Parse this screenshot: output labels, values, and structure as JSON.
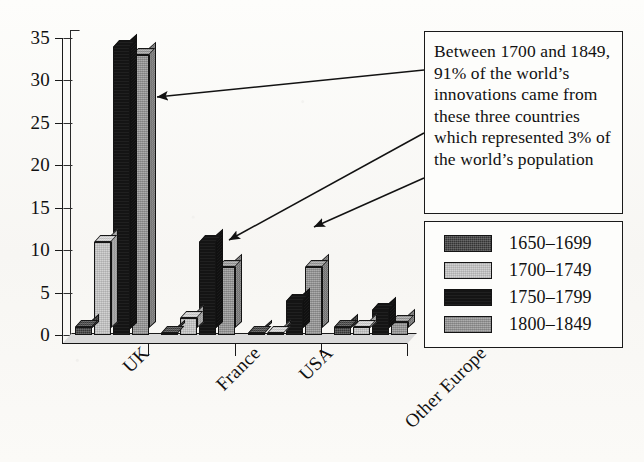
{
  "chart_data": {
    "type": "bar",
    "title": "",
    "subtitle": "",
    "xlabel": "",
    "ylabel": "",
    "categories": [
      "UK",
      "France",
      "USA",
      "Other Europe"
    ],
    "series": [
      {
        "name": "1650–1699",
        "color": "#343434",
        "values": [
          1,
          0.2,
          0.2,
          1
        ]
      },
      {
        "name": "1700–1749",
        "color": "#d2d2d2",
        "values": [
          11,
          2,
          0.2,
          1
        ]
      },
      {
        "name": "1750–1799",
        "color": "#141414",
        "values": [
          34,
          11,
          4,
          3
        ]
      },
      {
        "name": "1800–1849",
        "color": "#9d9d9d",
        "values": [
          33,
          8,
          8,
          1.5
        ]
      }
    ],
    "ylim": [
      0,
      35
    ],
    "ytick_labels": [
      "0",
      "5",
      "10",
      "15",
      "20",
      "25",
      "30",
      "35"
    ],
    "ytick_values": [
      0,
      5,
      10,
      15,
      20,
      25,
      30,
      35
    ],
    "grid": false,
    "legend_position": "right",
    "annotations": [
      {
        "text": "Between 1700 and 1849, 91% of the world’s innovations came from these three countries which represented 3% of the world’s population",
        "points_to": [
          "UK",
          "France",
          "USA"
        ]
      }
    ]
  },
  "axis": {
    "y_ticks": [
      {
        "label": "35",
        "value": 35
      },
      {
        "label": "30",
        "value": 30
      },
      {
        "label": "25",
        "value": 25
      },
      {
        "label": "20",
        "value": 20
      },
      {
        "label": "15",
        "value": 15
      },
      {
        "label": "10",
        "value": 10
      },
      {
        "label": "5",
        "value": 5
      },
      {
        "label": "0",
        "value": 0
      }
    ],
    "x_categories": [
      "UK",
      "France",
      "USA",
      "Other Europe"
    ]
  },
  "callout": {
    "text": "Between 1700 and 1849, 91% of the world’s innovations came from these three countries which represented 3% of the world’s population"
  },
  "legend": {
    "items": [
      {
        "label": "1650–1699",
        "color": "#343434"
      },
      {
        "label": "1700–1749",
        "color": "#d2d2d2"
      },
      {
        "label": "1750–1799",
        "color": "#141414"
      },
      {
        "label": "1800–1849",
        "color": "#9d9d9d"
      }
    ]
  }
}
